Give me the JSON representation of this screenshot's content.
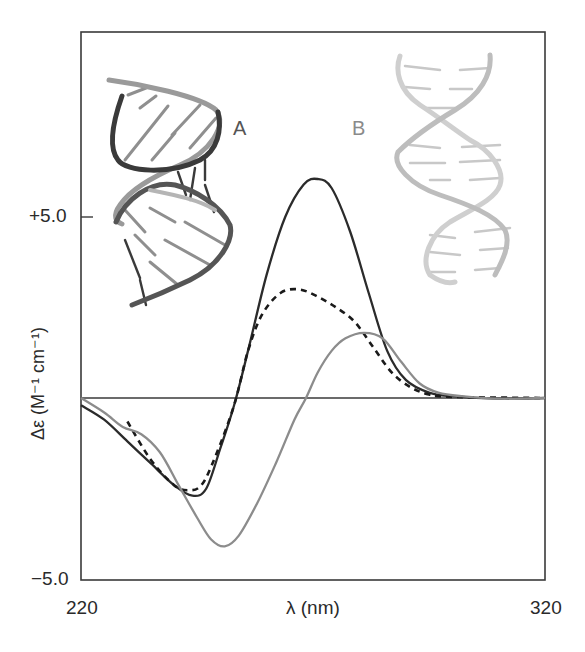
{
  "chart_data": {
    "type": "line",
    "title": "",
    "xlabel": "λ (nm)",
    "ylabel": "Δε (M⁻¹ cm⁻¹)",
    "xlim": [
      220,
      320
    ],
    "ylim": [
      -5.0,
      7.2
    ],
    "x_ticks": [
      {
        "value": 220,
        "label": "220"
      },
      {
        "value": 320,
        "label": "320"
      }
    ],
    "y_ticks": [
      {
        "value": 5.0,
        "label": "+5.0"
      },
      {
        "value": -5.0,
        "label": "−5.0"
      }
    ],
    "zero_line": true,
    "grid": false,
    "legend": null,
    "annotations": [
      {
        "text": "A",
        "description": "A-form double helix illustration (dark strands)",
        "color": "#555555"
      },
      {
        "text": "B",
        "description": "B-form double helix illustration (light strands)",
        "color": "#8a8a8a"
      }
    ],
    "series": [
      {
        "name": "A-form (solid black)",
        "style": "solid",
        "color": "#2b2b2b",
        "points": [
          [
            220,
            -0.2
          ],
          [
            225,
            -0.6
          ],
          [
            230,
            -1.2
          ],
          [
            235,
            -1.8
          ],
          [
            240,
            -2.4
          ],
          [
            244,
            -2.7
          ],
          [
            247,
            -2.5
          ],
          [
            250,
            -1.4
          ],
          [
            253,
            -0.2
          ],
          [
            256,
            1.3
          ],
          [
            260,
            3.4
          ],
          [
            264,
            5.0
          ],
          [
            268,
            5.9
          ],
          [
            271,
            6.05
          ],
          [
            274,
            5.8
          ],
          [
            278,
            4.6
          ],
          [
            282,
            2.9
          ],
          [
            286,
            1.3
          ],
          [
            290,
            0.5
          ],
          [
            295,
            0.15
          ],
          [
            300,
            0.05
          ],
          [
            310,
            -0.02
          ],
          [
            320,
            0.0
          ]
        ]
      },
      {
        "name": "Intermediate (dashed black)",
        "style": "dashed",
        "color": "#1a1a1a",
        "points": [
          [
            230,
            -0.65
          ],
          [
            235,
            -1.7
          ],
          [
            240,
            -2.4
          ],
          [
            243,
            -2.55
          ],
          [
            246,
            -2.4
          ],
          [
            249,
            -1.6
          ],
          [
            253,
            -0.2
          ],
          [
            256,
            1.3
          ],
          [
            259,
            2.3
          ],
          [
            263,
            2.9
          ],
          [
            267,
            3.0
          ],
          [
            271,
            2.8
          ],
          [
            275,
            2.5
          ],
          [
            279,
            2.1
          ],
          [
            283,
            1.4
          ],
          [
            287,
            0.7
          ],
          [
            291,
            0.3
          ],
          [
            295,
            0.1
          ],
          [
            300,
            0.03
          ],
          [
            320,
            0.0
          ]
        ]
      },
      {
        "name": "B-form (solid gray)",
        "style": "solid",
        "color": "#8c8c8c",
        "points": [
          [
            220,
            0.0
          ],
          [
            225,
            -0.4
          ],
          [
            229,
            -0.8
          ],
          [
            233,
            -1.0
          ],
          [
            237,
            -1.5
          ],
          [
            241,
            -2.4
          ],
          [
            245,
            -3.3
          ],
          [
            248,
            -3.9
          ],
          [
            251,
            -4.1
          ],
          [
            254,
            -3.8
          ],
          [
            258,
            -2.9
          ],
          [
            262,
            -1.8
          ],
          [
            266,
            -0.6
          ],
          [
            268.5,
            0.0
          ],
          [
            271,
            0.7
          ],
          [
            274,
            1.3
          ],
          [
            277,
            1.65
          ],
          [
            281,
            1.8
          ],
          [
            285,
            1.65
          ],
          [
            289,
            1.0
          ],
          [
            293,
            0.4
          ],
          [
            297,
            0.15
          ],
          [
            302,
            0.05
          ],
          [
            310,
            -0.02
          ],
          [
            320,
            0.0
          ]
        ]
      }
    ]
  },
  "labels": {
    "y_tick_top": "+5.0",
    "y_tick_bottom": "−5.0",
    "x_tick_left": "220",
    "x_tick_right": "320",
    "x_axis": "λ (nm)",
    "y_axis": "Δε (M⁻¹ cm⁻¹)",
    "annotation_a": "A",
    "annotation_b": "B"
  }
}
